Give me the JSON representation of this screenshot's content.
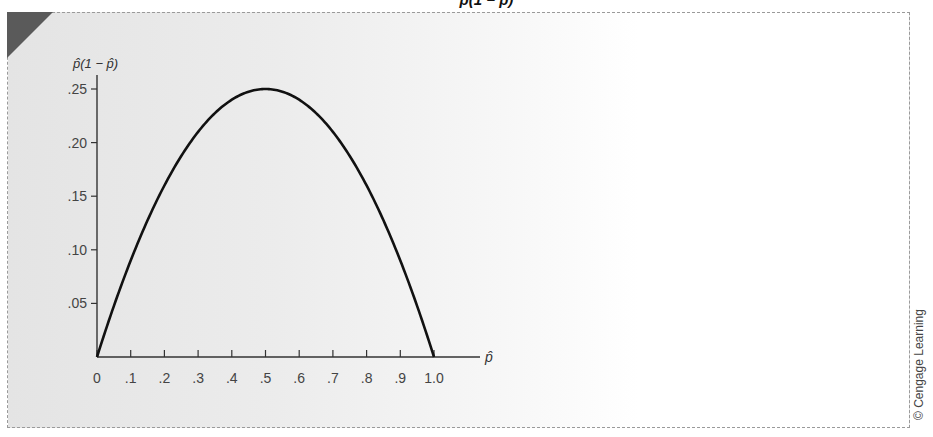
{
  "figure": {
    "title_fragment": "p̂(1 − p̂)",
    "credit": "© Cengage Learning",
    "colors": {
      "curve": "#111111",
      "axis": "#333333",
      "corner": "#5a5a5a"
    }
  },
  "chart_data": {
    "type": "line",
    "title": "",
    "xlabel": "p̂",
    "ylabel": "p̂(1 − p̂)",
    "x": [
      0,
      0.1,
      0.2,
      0.3,
      0.4,
      0.5,
      0.6,
      0.7,
      0.8,
      0.9,
      1.0
    ],
    "series": [
      {
        "name": "p̂(1 − p̂)",
        "values": [
          0,
          0.09,
          0.16,
          0.21,
          0.24,
          0.25,
          0.24,
          0.21,
          0.16,
          0.09,
          0
        ]
      }
    ],
    "x_ticks": [
      "0",
      ".1",
      ".2",
      ".3",
      ".4",
      ".5",
      ".6",
      ".7",
      ".8",
      ".9",
      "1.0"
    ],
    "y_ticks": [
      ".05",
      ".10",
      ".15",
      ".20",
      ".25"
    ],
    "xlim": [
      0,
      1.0
    ],
    "ylim": [
      0,
      0.25
    ],
    "grid": false,
    "legend": "none"
  }
}
